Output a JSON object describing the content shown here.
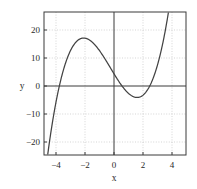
{
  "chart_data": {
    "type": "line",
    "title": "",
    "xlabel": "x",
    "ylabel": "y",
    "xlim": [
      -4.3,
      4.9
    ],
    "ylim": [
      -24.5,
      25.5
    ],
    "xticks": [
      -4,
      -2,
      0,
      2,
      4
    ],
    "xtick_labels": [
      "−4",
      "−2",
      "0",
      "2",
      "4"
    ],
    "yticks": [
      -20,
      -10,
      0,
      10,
      20
    ],
    "ytick_labels": [
      "−20",
      "−10",
      "0",
      "10",
      "20"
    ],
    "grid": true,
    "grid_style": "dotted",
    "legend": "none",
    "function": "y = x^3 - 9x + 6",
    "series": [
      {
        "name": "cubic",
        "color": "#434343",
        "x": [
          -4.3,
          -4.2,
          -4.1,
          -4.0,
          -3.9,
          -3.8,
          -3.7,
          -3.6,
          -3.5,
          -3.4,
          -3.3,
          -3.2,
          -3.1,
          -3.0,
          -2.9,
          -2.8,
          -2.7,
          -2.6,
          -2.5,
          -2.4,
          -2.3,
          -2.2,
          -2.1,
          -2.0,
          -1.9,
          -1.8,
          -1.7,
          -1.6,
          -1.5,
          -1.4,
          -1.3,
          -1.2,
          -1.1,
          -1.0,
          -0.9,
          -0.8,
          -0.7,
          -0.6,
          -0.5,
          -0.4,
          -0.3,
          -0.2,
          -0.1,
          0.0,
          0.1,
          0.2,
          0.3,
          0.4,
          0.5,
          0.6,
          0.7,
          0.8,
          0.9,
          1.0,
          1.1,
          1.2,
          1.3,
          1.4,
          1.5,
          1.6,
          1.7,
          1.8,
          1.9,
          2.0,
          2.1,
          2.2,
          2.3,
          2.4,
          2.5,
          2.6,
          2.7,
          2.8,
          2.9,
          3.0,
          3.1,
          3.2,
          3.3,
          3.4,
          3.5,
          3.6,
          3.7,
          3.8,
          3.9,
          4.0
        ],
        "y": [
          -34.71,
          -29.29,
          -24.22,
          -19.5,
          -15.12,
          -11.07,
          -7.35,
          -3.94,
          -0.85,
          1.94,
          4.44,
          7.07,
          8.04,
          6.0,
          7.7,
          9.25,
          10.6,
          11.82,
          12.88,
          13.78,
          14.53,
          15.15,
          15.64,
          16.0,
          16.24,
          16.37,
          16.39,
          16.3,
          16.13,
          15.86,
          15.5,
          15.07,
          14.57,
          14.0,
          13.37,
          12.69,
          11.96,
          11.18,
          10.38,
          9.54,
          8.67,
          7.79,
          6.9,
          6.0,
          5.1,
          4.21,
          3.33,
          2.46,
          1.62,
          0.82,
          0.04,
          -0.69,
          -1.37,
          -2.0,
          -2.57,
          -3.07,
          -3.5,
          -3.86,
          -4.13,
          -4.3,
          -4.39,
          -4.37,
          -4.24,
          -4.0,
          -3.64,
          -3.15,
          -2.53,
          -1.77,
          -0.88,
          0.18,
          1.38,
          2.75,
          4.29,
          6.0,
          7.89,
          9.97,
          12.24,
          14.7,
          17.37,
          20.26,
          23.35,
          20.67,
          26.0,
          29.0
        ]
      }
    ],
    "features": {
      "local_max": {
        "x": -1.7,
        "y": 16.4
      },
      "local_min": {
        "x": 1.7,
        "y": -4.4
      },
      "y_intercept": 6,
      "roots": [
        -3.2,
        0.7,
        2.5
      ]
    }
  },
  "axis": {
    "x_title": "x",
    "y_title": "y"
  }
}
